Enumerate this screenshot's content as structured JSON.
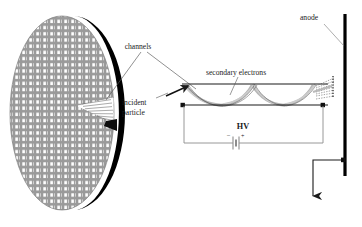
{
  "figure": {
    "background": "#ffffff"
  },
  "labels": {
    "channels": "channels",
    "incident_particle_line1": "incident",
    "incident_particle_line2": "particle",
    "secondary_electrons": "secondary electrons",
    "anode": "anode",
    "hv": "HV",
    "battery_minus": "–",
    "battery_plus": "+"
  },
  "colors": {
    "plate_face": "#9a9a9a",
    "plate_pore": "#ffffff",
    "plate_edge": "#000000",
    "line": "#1a1a1a",
    "circuit": "#8c8c8c",
    "cascade": "#b3b3b3",
    "text": "#1a1a1a",
    "anode_bar": "#000000"
  },
  "plate": {
    "name": "microchannel-plate",
    "center_x": 62,
    "center_y": 113,
    "radius_x": 52,
    "radius_y": 97,
    "pore_columns": 15,
    "pore_rows": 34,
    "notch_label": "cutaway wedge"
  },
  "channel": {
    "name": "single-channel-cross-section",
    "left_x": 182,
    "right_x": 328,
    "top_y": 84,
    "bottom_y": 105,
    "bounce_count": 3
  },
  "circuit": {
    "name": "hv-bias-circuit",
    "left_x": 184,
    "right_x": 323,
    "top_y": 105,
    "bottom_y": 143
  },
  "anode": {
    "name": "anode-electrode",
    "bar_x": 345,
    "bar_top": 14,
    "bar_bottom": 176,
    "signal_arrow_x": 313,
    "signal_arrow_bottom": 205
  }
}
